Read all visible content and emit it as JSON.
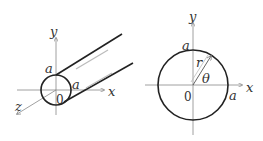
{
  "left_figure": {
    "description": "Cylinder along z-axis with circular cross-section",
    "labels": {
      "y_axis": "y",
      "x_axis": "x",
      "z_axis": "z",
      "radius_top": "a",
      "radius_right": "a",
      "origin": "0"
    }
  },
  "right_figure": {
    "description": "Circular cross-section with polar coordinates",
    "labels": {
      "y_axis": "y",
      "x_axis": "x",
      "radius_top": "a",
      "radius_right": "a",
      "origin": "0",
      "radius_var": "r",
      "angle_var": "θ"
    }
  },
  "colors": {
    "stroke": "#222222",
    "axis": "#888888",
    "highlight": "#bbbbbb"
  }
}
